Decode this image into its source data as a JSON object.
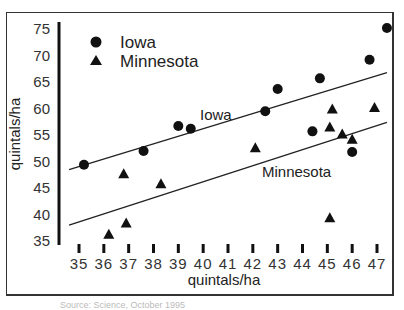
{
  "chart_data": {
    "type": "scatter",
    "title": "",
    "xlabel": "quintals/ha",
    "ylabel": "quintals/ha",
    "xlim": [
      35,
      47
    ],
    "ylim": [
      35,
      75
    ],
    "x_ticks": [
      35,
      36,
      37,
      38,
      39,
      40,
      41,
      42,
      43,
      44,
      45,
      46,
      47
    ],
    "y_ticks": [
      35,
      40,
      45,
      50,
      55,
      60,
      65,
      70,
      75
    ],
    "grid": false,
    "legend_position": "upper left",
    "series": [
      {
        "name": "Iowa",
        "marker": "circle",
        "color": "#111111",
        "points": [
          [
            35.2,
            49.2
          ],
          [
            37.6,
            51.8
          ],
          [
            39.0,
            56.5
          ],
          [
            39.5,
            56.0
          ],
          [
            42.5,
            59.3
          ],
          [
            43.0,
            63.5
          ],
          [
            44.4,
            55.5
          ],
          [
            44.7,
            65.5
          ],
          [
            46.0,
            51.6
          ],
          [
            46.7,
            69.0
          ],
          [
            47.4,
            75.0
          ]
        ],
        "trendline": {
          "start": [
            34.6,
            48.3
          ],
          "end": [
            47.4,
            66.6
          ],
          "label": "Iowa"
        }
      },
      {
        "name": "Minnesota",
        "marker": "triangle",
        "color": "#111111",
        "points": [
          [
            36.2,
            36.1
          ],
          [
            36.8,
            47.5
          ],
          [
            36.9,
            38.2
          ],
          [
            38.3,
            45.6
          ],
          [
            42.1,
            52.4
          ],
          [
            45.1,
            56.3
          ],
          [
            45.1,
            39.2
          ],
          [
            45.2,
            59.7
          ],
          [
            45.6,
            55.0
          ],
          [
            46.0,
            54.0
          ],
          [
            46.9,
            60.0
          ]
        ],
        "trendline": {
          "start": [
            34.6,
            37.8
          ],
          "end": [
            47.4,
            57.2
          ],
          "label": "Minnesota"
        }
      }
    ],
    "annotations": [
      "Iowa",
      "Minnesota"
    ]
  },
  "labels": {
    "legend_iowa": "Iowa",
    "legend_minnesota": "Minnesota",
    "line_label_iowa": "Iowa",
    "line_label_minnesota": "Minnesota",
    "x_axis_title": "quintals/ha",
    "y_axis_title": "quintals/ha",
    "caption": "Source: Science, October 1995"
  }
}
